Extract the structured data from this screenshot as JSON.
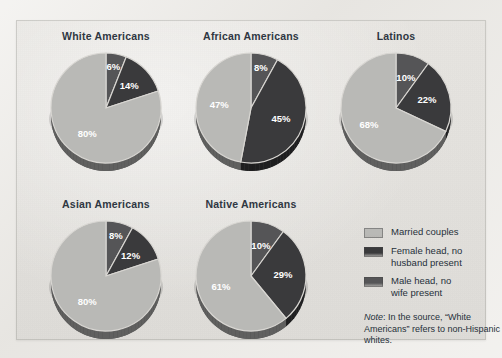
{
  "figure": {
    "background_color": "#e7e5e1",
    "title_color": "#2f3742"
  },
  "legend": {
    "position": "bottom-right",
    "items": [
      {
        "label": "Married couples",
        "color": "#b9b9b6",
        "key": "married"
      },
      {
        "label": "Female head, no\nhusband present",
        "color": "#3a3a3c",
        "key": "female_head"
      },
      {
        "label": "Male head, no\nwife present",
        "color": "#555557",
        "key": "male_head"
      }
    ]
  },
  "note": {
    "prefix": "Note",
    "text": ": In the source, “White Americans” refers to non-Hispanic whites."
  },
  "chart_data": {
    "type": "pie",
    "title": "",
    "legend_position": "bottom-right",
    "value_suffix": "%",
    "series_names": [
      "Male head, no wife present",
      "Female head, no husband present",
      "Married couples"
    ],
    "series_colors": [
      "#555557",
      "#3a3a3c",
      "#b9b9b6"
    ],
    "charts": [
      {
        "title": "White Americans",
        "categories": [
          "Male head, no wife present",
          "Female head, no husband present",
          "Married couples"
        ],
        "values": [
          6,
          14,
          80
        ],
        "labels": [
          "6%",
          "14%",
          "80%"
        ]
      },
      {
        "title": "African Americans",
        "categories": [
          "Male head, no wife present",
          "Female head, no husband present",
          "Married couples"
        ],
        "values": [
          8,
          45,
          47
        ],
        "labels": [
          "8%",
          "45%",
          "47%"
        ]
      },
      {
        "title": "Latinos",
        "categories": [
          "Male head, no wife present",
          "Female head, no husband present",
          "Married couples"
        ],
        "values": [
          10,
          22,
          68
        ],
        "labels": [
          "10%",
          "22%",
          "68%"
        ]
      },
      {
        "title": "Asian Americans",
        "categories": [
          "Male head, no wife present",
          "Female head, no husband present",
          "Married couples"
        ],
        "values": [
          8,
          12,
          80
        ],
        "labels": [
          "8%",
          "12%",
          "80%"
        ]
      },
      {
        "title": "Native Americans",
        "categories": [
          "Male head, no wife present",
          "Female head, no husband present",
          "Married couples"
        ],
        "values": [
          10,
          29,
          61
        ],
        "labels": [
          "10%",
          "29%",
          "61%"
        ]
      }
    ]
  }
}
